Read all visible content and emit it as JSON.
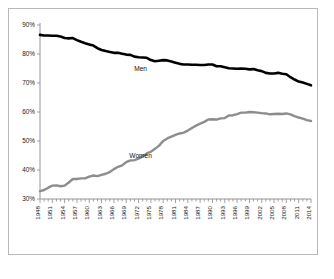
{
  "chart_data": {
    "type": "line",
    "title": "",
    "subtitle": "",
    "xlabel": "",
    "ylabel": "",
    "grid": false,
    "legend_position": "inline-annotation",
    "xlim": [
      1948,
      2014
    ],
    "ylim": [
      30,
      90
    ],
    "ytick_labels": [
      "90%",
      "80%",
      "70%",
      "60%",
      "50%",
      "40%",
      "30%"
    ],
    "ytick_values": [
      90,
      80,
      70,
      60,
      50,
      40,
      30
    ],
    "xtick_labels": [
      "1948",
      "1951",
      "1954",
      "1957",
      "1960",
      "1963",
      "1966",
      "1969",
      "1972",
      "1975",
      "1978",
      "1981",
      "1984",
      "1987",
      "1990",
      "1993",
      "1996",
      "1999",
      "2002",
      "2005",
      "2008",
      "2011",
      "2014"
    ],
    "xtick_values": [
      1948,
      1951,
      1954,
      1957,
      1960,
      1963,
      1966,
      1969,
      1972,
      1975,
      1978,
      1981,
      1984,
      1987,
      1990,
      1993,
      1996,
      1999,
      2002,
      2005,
      2008,
      2011,
      2014
    ],
    "minor_ticks_every_year": true,
    "x": [
      1948,
      1949,
      1950,
      1951,
      1952,
      1953,
      1954,
      1955,
      1956,
      1957,
      1958,
      1959,
      1960,
      1961,
      1962,
      1963,
      1964,
      1965,
      1966,
      1967,
      1968,
      1969,
      1970,
      1971,
      1972,
      1973,
      1974,
      1975,
      1976,
      1977,
      1978,
      1979,
      1980,
      1981,
      1982,
      1983,
      1984,
      1985,
      1986,
      1987,
      1988,
      1989,
      1990,
      1991,
      1992,
      1993,
      1994,
      1995,
      1996,
      1997,
      1998,
      1999,
      2000,
      2001,
      2002,
      2003,
      2004,
      2005,
      2006,
      2007,
      2008,
      2009,
      2010,
      2011,
      2012,
      2013,
      2014
    ],
    "series": [
      {
        "name": "Men",
        "color": "#000000",
        "label_text": "Men",
        "values": [
          86.6,
          86.4,
          86.4,
          86.3,
          86.3,
          86.0,
          85.5,
          85.4,
          85.5,
          84.8,
          84.2,
          83.7,
          83.3,
          82.9,
          82.0,
          81.4,
          81.0,
          80.7,
          80.4,
          80.4,
          80.1,
          79.8,
          79.7,
          79.1,
          78.9,
          78.8,
          78.7,
          77.9,
          77.5,
          77.7,
          77.9,
          77.8,
          77.4,
          77.0,
          76.6,
          76.4,
          76.4,
          76.3,
          76.3,
          76.2,
          76.2,
          76.4,
          76.4,
          75.8,
          75.8,
          75.4,
          75.1,
          75.0,
          74.9,
          75.0,
          74.9,
          74.7,
          74.8,
          74.4,
          74.1,
          73.5,
          73.3,
          73.3,
          73.5,
          73.2,
          73.0,
          72.0,
          71.2,
          70.5,
          70.2,
          69.7,
          69.2
        ]
      },
      {
        "name": "Women",
        "color": "#8d8d8d",
        "label_text": "Women",
        "values": [
          32.7,
          33.1,
          33.9,
          34.6,
          34.7,
          34.4,
          34.6,
          35.7,
          36.9,
          36.9,
          37.1,
          37.1,
          37.7,
          38.1,
          37.9,
          38.3,
          38.7,
          39.3,
          40.3,
          41.1,
          41.6,
          42.7,
          43.3,
          43.4,
          43.9,
          44.7,
          45.7,
          46.3,
          47.3,
          48.4,
          50.0,
          50.9,
          51.5,
          52.1,
          52.6,
          52.9,
          53.6,
          54.5,
          55.3,
          56.0,
          56.6,
          57.4,
          57.5,
          57.4,
          57.8,
          57.9,
          58.8,
          58.9,
          59.3,
          59.8,
          59.8,
          60.0,
          59.9,
          59.8,
          59.6,
          59.5,
          59.2,
          59.3,
          59.4,
          59.3,
          59.5,
          59.2,
          58.6,
          58.1,
          57.7,
          57.2,
          56.9
        ]
      }
    ]
  },
  "caption": {
    "text": ""
  }
}
